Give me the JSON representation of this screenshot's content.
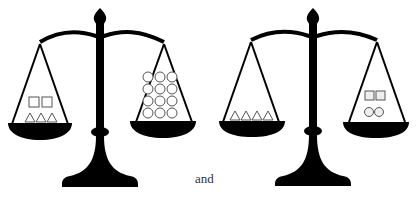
{
  "figure": {
    "connector_text": "and",
    "colors": {
      "scale": "#000000",
      "shape_stroke": "#555555",
      "background": "#ffffff"
    }
  },
  "scales": [
    {
      "id": "scale-1",
      "left_pan": {
        "items": [
          {
            "shape": "square",
            "count": 2
          },
          {
            "shape": "triangle",
            "count": 3
          }
        ]
      },
      "right_pan": {
        "items": [
          {
            "shape": "circle",
            "count": 12
          }
        ]
      },
      "balanced": true
    },
    {
      "id": "scale-2",
      "left_pan": {
        "items": [
          {
            "shape": "triangle",
            "count": 4
          }
        ]
      },
      "right_pan": {
        "items": [
          {
            "shape": "square",
            "count": 2
          },
          {
            "shape": "circle",
            "count": 2
          }
        ]
      },
      "balanced": true
    }
  ]
}
